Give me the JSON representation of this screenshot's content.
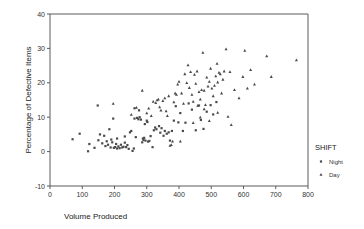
{
  "chart_data": {
    "type": "scatter",
    "title": "",
    "xlabel": "Volume Produced",
    "ylabel": "Percentage of Defective Items",
    "xlim": [
      0,
      800
    ],
    "ylim": [
      -10,
      40
    ],
    "xticks": [
      0,
      100,
      200,
      300,
      400,
      500,
      600,
      700,
      800
    ],
    "yticks": [
      -10,
      0,
      10,
      20,
      30,
      40
    ],
    "grid": false,
    "legend": {
      "title": "SHIFT",
      "position": "right",
      "entries": [
        {
          "name": "Night",
          "marker": "square"
        },
        {
          "name": "Day",
          "marker": "triangle"
        }
      ]
    },
    "series": [
      {
        "name": "Night",
        "marker": "square",
        "points": [
          [
            70,
            3.6
          ],
          [
            92,
            5.2
          ],
          [
            118,
            0.1
          ],
          [
            122,
            2.2
          ],
          [
            138,
            1.1
          ],
          [
            150,
            3.3
          ],
          [
            155,
            5.0
          ],
          [
            162,
            2.4
          ],
          [
            168,
            4.6
          ],
          [
            172,
            1.6
          ],
          [
            176,
            3.0
          ],
          [
            180,
            2.0
          ],
          [
            184,
            6.5
          ],
          [
            188,
            1.2
          ],
          [
            190,
            3.5
          ],
          [
            193,
            2.7
          ],
          [
            196,
            9.6
          ],
          [
            198,
            1.1
          ],
          [
            202,
            1.3
          ],
          [
            205,
            2.2
          ],
          [
            208,
            0.9
          ],
          [
            212,
            1.5
          ],
          [
            216,
            1.0
          ],
          [
            220,
            2.0
          ],
          [
            224,
            1.2
          ],
          [
            228,
            1.4
          ],
          [
            232,
            2.6
          ],
          [
            236,
            1.3
          ],
          [
            240,
            1.9
          ],
          [
            244,
            0.8
          ],
          [
            248,
            5.6
          ],
          [
            252,
            6.0
          ],
          [
            256,
            0.2
          ],
          [
            260,
            0.9
          ],
          [
            262,
            9.6
          ],
          [
            266,
            4.2
          ],
          [
            270,
            9.8
          ],
          [
            274,
            9.4
          ],
          [
            278,
            10.0
          ],
          [
            282,
            9.3
          ],
          [
            286,
            2.7
          ],
          [
            288,
            3.8
          ],
          [
            290,
            3.4
          ],
          [
            292,
            4.0
          ],
          [
            294,
            8.0
          ],
          [
            296,
            3.2
          ],
          [
            300,
            9.0
          ],
          [
            302,
            8.6
          ],
          [
            304,
            2.9
          ],
          [
            308,
            3.1
          ],
          [
            312,
            4.5
          ],
          [
            318,
            1.3
          ],
          [
            322,
            6.2
          ],
          [
            326,
            7.0
          ],
          [
            330,
            6.5
          ],
          [
            338,
            7.4
          ],
          [
            342,
            5.5
          ],
          [
            346,
            6.8
          ],
          [
            352,
            4.6
          ],
          [
            356,
            6.0
          ],
          [
            362,
            5.2
          ],
          [
            368,
            5.6
          ],
          [
            372,
            3.2
          ],
          [
            378,
            6.0
          ],
          [
            384,
            9.0
          ],
          [
            390,
            13.2
          ],
          [
            398,
            8.5
          ],
          [
            404,
            11.2
          ],
          [
            412,
            6.0
          ],
          [
            420,
            8.4
          ],
          [
            430,
            14.0
          ],
          [
            440,
            12.2
          ],
          [
            452,
            6.2
          ],
          [
            462,
            13.4
          ],
          [
            468,
            9.2
          ],
          [
            476,
            6.6
          ],
          [
            486,
            11.6
          ],
          [
            498,
            13.5
          ],
          [
            506,
            10.8
          ],
          [
            516,
            14.4
          ],
          [
            148,
            13.4
          ],
          [
            262,
            12.6
          ],
          [
            276,
            12.0
          ],
          [
            208,
            3.8
          ],
          [
            232,
            4.4
          ]
        ]
      },
      {
        "name": "Day",
        "marker": "triangle",
        "points": [
          [
            196,
            14.0
          ],
          [
            252,
            10.8
          ],
          [
            268,
            12.8
          ],
          [
            286,
            17.8
          ],
          [
            300,
            11.2
          ],
          [
            306,
            12.6
          ],
          [
            314,
            10.4
          ],
          [
            320,
            14.6
          ],
          [
            328,
            14.2
          ],
          [
            332,
            15.0
          ],
          [
            336,
            15.2
          ],
          [
            340,
            13.0
          ],
          [
            344,
            12.0
          ],
          [
            350,
            14.8
          ],
          [
            356,
            15.6
          ],
          [
            360,
            11.8
          ],
          [
            364,
            10.4
          ],
          [
            368,
            16.2
          ],
          [
            372,
            1.8
          ],
          [
            376,
            2.0
          ],
          [
            380,
            3.0
          ],
          [
            384,
            14.4
          ],
          [
            388,
            17.0
          ],
          [
            392,
            16.6
          ],
          [
            396,
            19.6
          ],
          [
            400,
            20.4
          ],
          [
            404,
            3.0
          ],
          [
            408,
            17.0
          ],
          [
            414,
            14.0
          ],
          [
            418,
            22.6
          ],
          [
            424,
            20.0
          ],
          [
            428,
            25.2
          ],
          [
            432,
            18.6
          ],
          [
            436,
            23.2
          ],
          [
            440,
            16.6
          ],
          [
            444,
            14.6
          ],
          [
            448,
            22.4
          ],
          [
            452,
            19.8
          ],
          [
            456,
            23.4
          ],
          [
            458,
            13.4
          ],
          [
            462,
            17.4
          ],
          [
            466,
            15.2
          ],
          [
            470,
            18.0
          ],
          [
            474,
            28.8
          ],
          [
            478,
            17.8
          ],
          [
            482,
            13.6
          ],
          [
            486,
            21.6
          ],
          [
            490,
            19.0
          ],
          [
            494,
            20.4
          ],
          [
            498,
            24.2
          ],
          [
            502,
            18.4
          ],
          [
            506,
            16.2
          ],
          [
            510,
            19.2
          ],
          [
            514,
            22.0
          ],
          [
            518,
            25.6
          ],
          [
            520,
            20.2
          ],
          [
            524,
            23.0
          ],
          [
            528,
            22.6
          ],
          [
            532,
            17.0
          ],
          [
            536,
            21.0
          ],
          [
            540,
            23.4
          ],
          [
            546,
            29.8
          ],
          [
            552,
            10.2
          ],
          [
            558,
            23.2
          ],
          [
            562,
            7.8
          ],
          [
            572,
            18.0
          ],
          [
            586,
            15.6
          ],
          [
            598,
            21.8
          ],
          [
            604,
            29.4
          ],
          [
            612,
            18.4
          ],
          [
            622,
            23.8
          ],
          [
            634,
            19.6
          ],
          [
            672,
            27.8
          ],
          [
            686,
            21.8
          ],
          [
            764,
            26.6
          ],
          [
            478,
            12.4
          ],
          [
            494,
            9.0
          ],
          [
            520,
            11.4
          ],
          [
            444,
            8.4
          ],
          [
            466,
            10.0
          ]
        ]
      }
    ]
  }
}
